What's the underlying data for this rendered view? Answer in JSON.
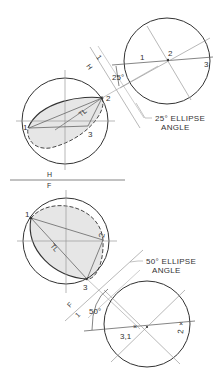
{
  "top_view": {
    "points": {
      "p1": "1",
      "p2": "2",
      "p3": "3"
    },
    "true_length": "TL"
  },
  "aux_view_h1": {
    "fold_label_h": "H",
    "fold_label_1": "1",
    "angle": "25°",
    "points": {
      "p1": "1",
      "p2": "2",
      "p3": "3"
    },
    "caption_line1": "25° ELLIPSE",
    "caption_line2": "ANGLE"
  },
  "fold_line_hf": {
    "label_top": "H",
    "label_bottom": "F"
  },
  "front_view": {
    "points": {
      "p1": "1",
      "p2": "2",
      "p3": "3"
    },
    "true_length": "TL"
  },
  "aux_view_f1": {
    "fold_label_f": "F",
    "fold_label_1": "1",
    "angle": "50°",
    "points": {
      "p31": "3,1",
      "p2": "2"
    },
    "caption_line1": "50° ELLIPSE",
    "caption_line2": "ANGLE"
  },
  "colors": {
    "line": "#333333",
    "construction": "#9a9a9a",
    "shade": "#e6e6e6"
  }
}
